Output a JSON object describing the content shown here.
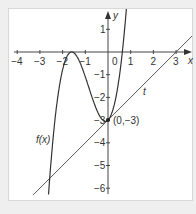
{
  "chart_data": {
    "type": "line",
    "title": "",
    "xlabel": "x",
    "ylabel": "y",
    "xlim": [
      -4.3,
      3.8
    ],
    "ylim": [
      -6.5,
      1.9
    ],
    "x_ticks": [
      -4,
      -3,
      -2,
      -1,
      0,
      1,
      2,
      3
    ],
    "y_ticks": [
      1,
      -1,
      -2,
      -3,
      -4,
      -5,
      -6
    ],
    "x_tick_labels": [
      "−4",
      "−3",
      "−2",
      "−1",
      "0",
      "1",
      "2",
      "3"
    ],
    "y_tick_labels": [
      "1",
      "−1",
      "−2",
      "−3",
      "−4",
      "−5",
      "−6"
    ],
    "grid": false,
    "series": [
      {
        "name": "f(x)",
        "kind": "cubic",
        "formula": "1.855*(x+1.6)^2*(x-0.632)",
        "x_range": [
          -2.62,
          0.86
        ]
      },
      {
        "name": "t",
        "kind": "tangent line",
        "formula": "x-3",
        "x_range": [
          -3.3,
          3.8
        ]
      }
    ],
    "annotations": [
      {
        "text": "(0,−3)",
        "x": 0,
        "y": -3,
        "point": true
      },
      {
        "text": "f(x)",
        "label_for": "curve"
      },
      {
        "text": "t",
        "label_for": "tangent"
      }
    ]
  },
  "labels": {
    "x_axis": "x",
    "y_axis": "y",
    "curve": "f(x)",
    "tangent": "t",
    "point": "(0,−3)",
    "origin": "0"
  }
}
